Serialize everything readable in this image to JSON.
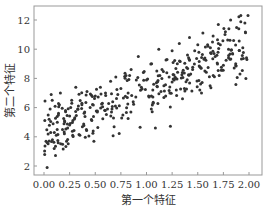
{
  "chart_data": {
    "type": "scatter",
    "title": "",
    "xlabel": "第一个特征",
    "ylabel": "第二个特征",
    "xlim": [
      -0.06,
      2.08
    ],
    "ylim": [
      1.5,
      13.0
    ],
    "xticks": [
      "0.00",
      "0.25",
      "0.50",
      "0.75",
      "1.00",
      "1.25",
      "1.50",
      "1.75",
      "2.00"
    ],
    "yticks": [
      "2",
      "4",
      "6",
      "8",
      "10",
      "12"
    ],
    "grid": false,
    "legend": null,
    "marker_color": "#333333",
    "series": [
      {
        "name": "data",
        "points": [
          [
            0.03,
            1.9
          ],
          [
            0.02,
            3.7
          ],
          [
            0.03,
            3.6
          ],
          [
            0.04,
            4.2
          ],
          [
            0.05,
            5.2
          ],
          [
            0.06,
            5.9
          ],
          [
            0.08,
            6.5
          ],
          [
            0.07,
            6.9
          ],
          [
            0.1,
            4.3
          ],
          [
            0.12,
            4.1
          ],
          [
            0.13,
            5.0
          ],
          [
            0.14,
            5.5
          ],
          [
            0.15,
            6.2
          ],
          [
            0.16,
            7.0
          ],
          [
            0.18,
            4.5
          ],
          [
            0.2,
            5.1
          ],
          [
            0.21,
            5.8
          ],
          [
            0.22,
            3.7
          ],
          [
            0.23,
            4.6
          ],
          [
            0.25,
            4.8
          ],
          [
            0.26,
            6.0
          ],
          [
            0.27,
            6.5
          ],
          [
            0.28,
            4.1
          ],
          [
            0.3,
            5.3
          ],
          [
            0.31,
            7.4
          ],
          [
            0.33,
            5.9
          ],
          [
            0.35,
            4.1
          ],
          [
            0.37,
            6.3
          ],
          [
            0.4,
            5.4
          ],
          [
            0.42,
            7.1
          ],
          [
            0.45,
            6.0
          ],
          [
            0.48,
            4.4
          ],
          [
            0.5,
            6.8
          ],
          [
            0.52,
            5.7
          ],
          [
            0.55,
            7.4
          ],
          [
            0.57,
            6.3
          ],
          [
            0.6,
            7.0
          ],
          [
            0.62,
            5.9
          ],
          [
            0.65,
            7.8
          ],
          [
            0.67,
            6.4
          ],
          [
            0.7,
            8.1
          ],
          [
            0.72,
            6.9
          ],
          [
            0.75,
            7.3
          ],
          [
            0.77,
            5.5
          ],
          [
            0.8,
            8.2
          ],
          [
            0.82,
            7.0
          ],
          [
            0.85,
            8.6
          ],
          [
            0.87,
            6.4
          ],
          [
            0.9,
            7.9
          ],
          [
            0.92,
            9.5
          ],
          [
            0.95,
            7.4
          ],
          [
            0.97,
            8.4
          ],
          [
            1.0,
            7.9
          ],
          [
            1.02,
            6.8
          ],
          [
            1.05,
            9.0
          ],
          [
            1.07,
            7.6
          ],
          [
            1.1,
            8.5
          ],
          [
            1.12,
            10.0
          ],
          [
            1.15,
            8.0
          ],
          [
            1.17,
            6.7
          ],
          [
            1.2,
            9.3
          ],
          [
            1.22,
            8.1
          ],
          [
            1.25,
            9.9
          ],
          [
            1.27,
            7.9
          ],
          [
            1.3,
            9.0
          ],
          [
            1.32,
            10.4
          ],
          [
            1.35,
            8.4
          ],
          [
            1.37,
            7.3
          ],
          [
            1.4,
            9.6
          ],
          [
            1.42,
            10.8
          ],
          [
            1.45,
            8.6
          ],
          [
            1.47,
            9.9
          ],
          [
            1.5,
            10.3
          ],
          [
            1.52,
            8.8
          ],
          [
            1.55,
            11.1
          ],
          [
            1.57,
            9.4
          ],
          [
            1.6,
            10.2
          ],
          [
            1.62,
            7.5
          ],
          [
            1.65,
            10.9
          ],
          [
            1.67,
            9.5
          ],
          [
            1.7,
            11.7
          ],
          [
            1.72,
            10.3
          ],
          [
            1.75,
            8.9
          ],
          [
            1.77,
            11.2
          ],
          [
            1.8,
            10.0
          ],
          [
            1.82,
            12.0
          ],
          [
            1.85,
            10.6
          ],
          [
            1.87,
            9.0
          ],
          [
            1.9,
            11.4
          ],
          [
            1.92,
            12.3
          ],
          [
            1.94,
            10.1
          ],
          [
            1.96,
            11.8
          ],
          [
            1.98,
            9.3
          ],
          [
            1.99,
            12.3
          ],
          [
            1.97,
            8.0
          ]
        ]
      }
    ],
    "generator": {
      "intercept": 4,
      "slope": 3,
      "noise_sd": 1,
      "n": 300,
      "seed": 42
    }
  }
}
